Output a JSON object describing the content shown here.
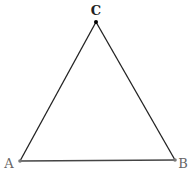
{
  "diagram": {
    "type": "triangle",
    "vertices": [
      {
        "label": "A",
        "x": 20,
        "y": 161,
        "label_x": 9,
        "label_y": 168,
        "color": "#777777",
        "label_color": "#666666",
        "bold": false
      },
      {
        "label": "B",
        "x": 175,
        "y": 160,
        "label_x": 183,
        "label_y": 168,
        "color": "#777777",
        "label_color": "#666666",
        "bold": false
      },
      {
        "label": "C",
        "x": 96,
        "y": 22,
        "label_x": 96,
        "label_y": 15,
        "color": "#000000",
        "label_color": "#222222",
        "bold": true
      }
    ],
    "edges": [
      {
        "from": "A",
        "to": "B",
        "color": "#444444"
      },
      {
        "from": "B",
        "to": "C",
        "color": "#222222"
      },
      {
        "from": "C",
        "to": "A",
        "color": "#222222"
      }
    ]
  }
}
